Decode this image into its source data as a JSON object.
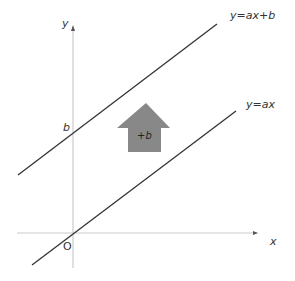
{
  "diagram": {
    "axes": {
      "x_label": "x",
      "y_label": "y",
      "origin_label": "O",
      "color": "#c8c8c8"
    },
    "lines": [
      {
        "label": "y=ax+b",
        "color": "#333333"
      },
      {
        "label": "y=ax",
        "color": "#333333"
      }
    ],
    "intercept_label": "b",
    "shift_arrow": {
      "label": "+b",
      "color": "#888888"
    }
  }
}
